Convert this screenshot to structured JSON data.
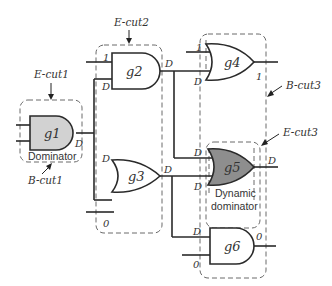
{
  "gates": [
    {
      "id": "g1",
      "label": "g1",
      "type": "AND",
      "fill": "#d2d2d2"
    },
    {
      "id": "g2",
      "label": "g2",
      "type": "AND",
      "fill": "#ffffff"
    },
    {
      "id": "g3",
      "label": "g3",
      "type": "OR",
      "fill": "#ffffff"
    },
    {
      "id": "g4",
      "label": "g4",
      "type": "OR",
      "fill": "#ffffff"
    },
    {
      "id": "g5",
      "label": "g5",
      "type": "OR",
      "fill": "#8e8e8e"
    },
    {
      "id": "g6",
      "label": "g6",
      "type": "AND",
      "fill": "#ffffff"
    }
  ],
  "signals": {
    "g1_out": "D",
    "g2_in1": "1",
    "g2_in2": "D",
    "g2_out": "D",
    "g3_in1": "D",
    "g3_in2": "0",
    "g3_out": "D",
    "g4_in1": "1",
    "g4_in2": "D",
    "g4_out": "1",
    "g5_in1": "D",
    "g5_in2": "D",
    "g5_out": "D",
    "g6_in1": "D",
    "g6_in2": "0",
    "g6_out": "0"
  },
  "cuts": {
    "ecut1": "E-cut1",
    "ecut2": "E-cut2",
    "ecut3": "E-cut3",
    "bcut1": "B-cut1",
    "bcut3": "B-cut3"
  },
  "annotations": {
    "dominator": "Dominator",
    "dynamic_line1": "Dynamic",
    "dynamic_line2": "dominator"
  }
}
